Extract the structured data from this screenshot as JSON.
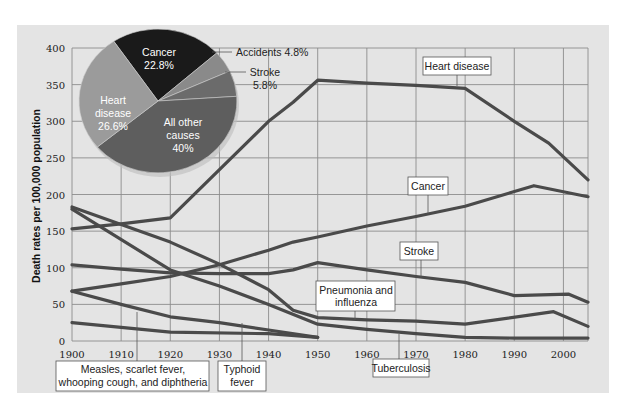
{
  "chart_data": {
    "type": "line",
    "title": "",
    "xlabel": "",
    "ylabel": "Death rates per 100,000 population",
    "xlim": [
      1900,
      2005
    ],
    "ylim": [
      0,
      400
    ],
    "grid": true,
    "x_ticks": [
      1900,
      1910,
      1920,
      1930,
      1940,
      1950,
      1960,
      1970,
      1980,
      1990,
      2000
    ],
    "x_tick_labels": [
      "1900",
      "1910",
      "1920",
      "1930",
      "1940",
      "1950",
      "1960",
      "1970",
      "1980",
      "1990",
      "2000"
    ],
    "y_ticks": [
      0,
      50,
      100,
      150,
      200,
      250,
      300,
      350,
      400
    ],
    "y_tick_labels": [
      "0",
      "50",
      "100",
      "150",
      "200",
      "250",
      "300",
      "350",
      "400"
    ],
    "line_color": "#4a4a4a",
    "series": [
      {
        "name": "Heart disease",
        "points": [
          [
            1900,
            153
          ],
          [
            1910,
            160
          ],
          [
            1920,
            168
          ],
          [
            1940,
            300
          ],
          [
            1945,
            326
          ],
          [
            1950,
            356
          ],
          [
            1960,
            352
          ],
          [
            1970,
            349
          ],
          [
            1980,
            345
          ],
          [
            1990,
            300
          ],
          [
            1997,
            270
          ],
          [
            2005,
            220
          ]
        ],
        "label_anchor": [
          1975,
          349
        ],
        "label_pos": "above"
      },
      {
        "name": "Cancer",
        "points": [
          [
            1900,
            68
          ],
          [
            1910,
            78
          ],
          [
            1920,
            88
          ],
          [
            1930,
            104
          ],
          [
            1940,
            124
          ],
          [
            1945,
            135
          ],
          [
            1950,
            142
          ],
          [
            1960,
            157
          ],
          [
            1970,
            170
          ],
          [
            1980,
            184
          ],
          [
            1994,
            212
          ],
          [
            2005,
            197
          ]
        ],
        "label_anchor": [
          1972,
          172
        ],
        "label_pos": "above"
      },
      {
        "name": "Stroke",
        "points": [
          [
            1900,
            104
          ],
          [
            1910,
            98
          ],
          [
            1920,
            93
          ],
          [
            1930,
            92
          ],
          [
            1940,
            92
          ],
          [
            1945,
            97
          ],
          [
            1950,
            107
          ],
          [
            1960,
            97
          ],
          [
            1970,
            88
          ],
          [
            1980,
            80
          ],
          [
            1990,
            62
          ],
          [
            2001,
            64
          ],
          [
            2005,
            53
          ]
        ],
        "label_anchor": [
          1972,
          86
        ],
        "label_pos": "above"
      },
      {
        "name": "Pneumonia and influenza",
        "points": [
          [
            1900,
            183
          ],
          [
            1920,
            135
          ],
          [
            1930,
            105
          ],
          [
            1940,
            70
          ],
          [
            1945,
            42
          ],
          [
            1950,
            32
          ],
          [
            1960,
            29
          ],
          [
            1970,
            27
          ],
          [
            1980,
            23
          ],
          [
            1998,
            40
          ],
          [
            2005,
            20
          ]
        ],
        "label_anchor": [
          1958,
          29
        ],
        "label_pos": "above"
      },
      {
        "name": "Tuberculosis",
        "points": [
          [
            1900,
            180
          ],
          [
            1920,
            97
          ],
          [
            1930,
            75
          ],
          [
            1940,
            50
          ],
          [
            1950,
            23
          ],
          [
            1960,
            16
          ],
          [
            1970,
            10
          ],
          [
            1980,
            5
          ],
          [
            1990,
            4
          ],
          [
            2005,
            4
          ]
        ],
        "label_anchor": [
          1966,
          12
        ],
        "label_pos": "below"
      },
      {
        "name": "Typhoid fever",
        "points": [
          [
            1900,
            68
          ],
          [
            1910,
            50
          ],
          [
            1920,
            33
          ],
          [
            1930,
            25
          ],
          [
            1940,
            15
          ],
          [
            1950,
            5
          ]
        ],
        "label_anchor": [
          1935,
          22
        ],
        "label_pos": "below"
      },
      {
        "name": "Measles, scarlet fever, whooping cough, and diphtheria",
        "points": [
          [
            1900,
            25
          ],
          [
            1920,
            12
          ],
          [
            1940,
            10
          ],
          [
            1950,
            5
          ]
        ],
        "label_anchor": [
          1913,
          16
        ],
        "label_pos": "below"
      }
    ],
    "inset_pie": {
      "type": "pie",
      "slices": [
        {
          "name": "Cancer",
          "value": 22.8,
          "label": "Cancer",
          "value_label": "22.8%",
          "color": "#1a1a1a",
          "text_inside": true
        },
        {
          "name": "Accidents",
          "value": 4.8,
          "label": "Accidents",
          "value_label": "4.8%",
          "color": "#8a8a8a",
          "text_inside": false
        },
        {
          "name": "Stroke",
          "value": 5.8,
          "label": "Stroke",
          "value_label": "5.8%",
          "color": "#6b6b6b",
          "text_inside": false
        },
        {
          "name": "All other causes",
          "value": 40,
          "label": "All other causes",
          "value_label": "40%",
          "color": "#5e5e5e",
          "text_inside": true
        },
        {
          "name": "Heart disease",
          "value": 26.6,
          "label": "Heart disease",
          "value_label": "26.6%",
          "color": "#9b9b9b",
          "text_inside": true
        }
      ]
    }
  },
  "labels": {
    "heart_disease": "Heart disease",
    "cancer": "Cancer",
    "stroke": "Stroke",
    "pneumonia_line1": "Pneumonia and",
    "pneumonia_line2": "influenza",
    "tuberculosis": "Tuberculosis",
    "typhoid_line1": "Typhoid",
    "typhoid_line2": "fever",
    "measles_line1": "Measles, scarlet fever,",
    "measles_line2": "whooping cough, and diphtheria",
    "pie_cancer_1": "Cancer",
    "pie_cancer_2": "22.8%",
    "pie_heart_1": "Heart",
    "pie_heart_2": "disease",
    "pie_heart_3": "26.6%",
    "pie_other_1": "All other",
    "pie_other_2": "causes",
    "pie_other_3": "40%",
    "pie_accidents": "Accidents 4.8%",
    "pie_stroke_1": "Stroke",
    "pie_stroke_2": "5.8%"
  },
  "colors": {
    "panel_bg": "#e4e4e4",
    "grid": "#8c8c8c",
    "line": "#4a4a4a",
    "label_box_bg": "#ffffff",
    "label_box_border": "#555555"
  }
}
